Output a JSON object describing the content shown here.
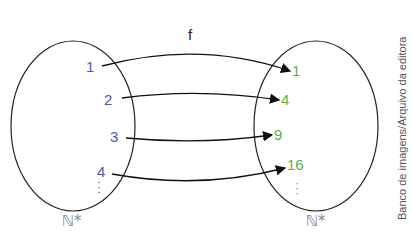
{
  "function_label": "f",
  "domain_set": {
    "name": "ℕ*",
    "elements": [
      "1",
      "2",
      "3",
      "4"
    ],
    "ellipsis": "⋮",
    "color": "#4a5aa8"
  },
  "codomain_set": {
    "name": "ℕ*",
    "elements": [
      "1",
      "4",
      "9",
      "16"
    ],
    "ellipsis": "⋮",
    "color": "#5ab04a"
  },
  "mappings": [
    {
      "from": "1",
      "to": "1"
    },
    {
      "from": "2",
      "to": "4"
    },
    {
      "from": "3",
      "to": "9"
    },
    {
      "from": "4",
      "to": "16"
    }
  ],
  "credit": "Banco de imagens/Arquivo da editora"
}
